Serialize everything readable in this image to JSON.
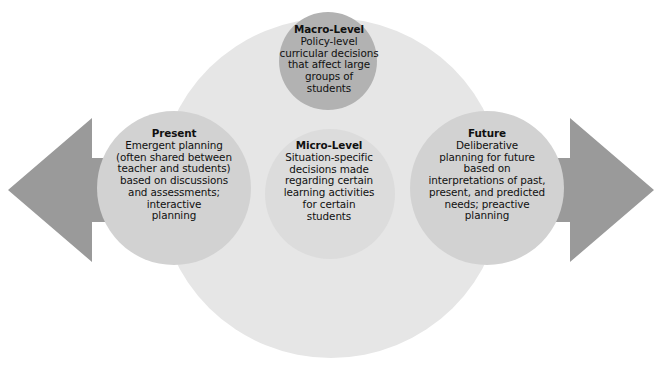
{
  "diagram": {
    "type": "venn-overlap-with-bidirectional-arrow",
    "background_color": "#ffffff",
    "arrow": {
      "name": "bidirectional-time-arrow",
      "color": "#9a9a9a",
      "direction": "left-and-right"
    },
    "lens": {
      "name": "background-lens",
      "color": "#e6e6e6"
    },
    "nodes": [
      {
        "id": "macro",
        "title": "Macro-Level",
        "body": "Policy-level\ncurricular decisions\nthat affect large\ngroups of\nstudents",
        "color": "#b2b2b2"
      },
      {
        "id": "micro",
        "title": "Micro-Level",
        "body": "Situation-specific\ndecisions made\nregarding certain\nlearning activities\nfor certain\nstudents",
        "color": "#dcdcdc"
      },
      {
        "id": "present",
        "title": "Present",
        "body": "Emergent planning\n(often shared between\nteacher and students)\nbased on discussions\nand assessments;\ninteractive\nplanning",
        "color": "#d2d2d2"
      },
      {
        "id": "future",
        "title": "Future",
        "body": "Deliberative\nplanning for future\nbased on\ninterpretations of past,\npresent, and predicted\nneeds; preactive\nplanning",
        "color": "#d2d2d2"
      }
    ]
  }
}
